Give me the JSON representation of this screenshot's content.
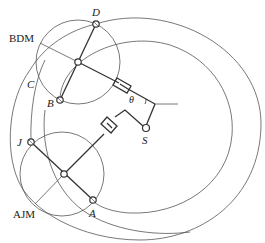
{
  "diagram": {
    "type": "mechanism-schematic",
    "labels": {
      "D": "D",
      "BDM": "BDM",
      "C": "C",
      "B": "B",
      "theta": "θ",
      "S": "S",
      "J": "J",
      "AJM": "AJM",
      "A": "A"
    },
    "colors": {
      "line": "#333333",
      "thin_line": "#555555",
      "background": "#ffffff"
    }
  }
}
